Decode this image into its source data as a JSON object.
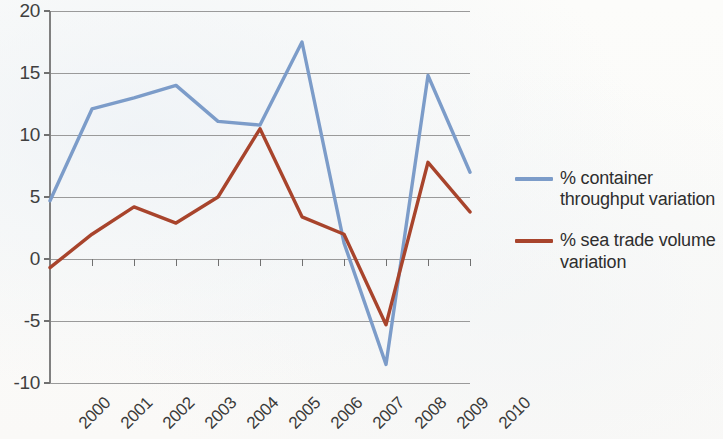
{
  "chart_data": {
    "type": "line",
    "title": "",
    "xlabel": "",
    "ylabel": "",
    "categories": [
      "2000",
      "2001",
      "2002",
      "2003",
      "2004",
      "2005",
      "2006",
      "2007",
      "2008",
      "2009",
      "2010"
    ],
    "ylim": [
      -10,
      20
    ],
    "yticks": [
      -10,
      -5,
      0,
      5,
      10,
      15,
      20
    ],
    "ytick_labels": [
      "-10",
      "-5",
      "0",
      "5",
      "10",
      "15",
      "20"
    ],
    "grid": true,
    "grid_axis": "y",
    "legend_position": "right",
    "series": [
      {
        "name": "% container throughput variation",
        "color": "#7c9cc9",
        "values": [
          4.7,
          12.1,
          13.0,
          14.0,
          11.1,
          10.8,
          17.5,
          1.3,
          -8.5,
          14.8,
          7.0
        ]
      },
      {
        "name": "% sea trade volume variation",
        "color": "#a8442c",
        "values": [
          -0.7,
          2.0,
          4.2,
          2.9,
          5.0,
          10.5,
          3.4,
          2.0,
          -5.3,
          7.8,
          3.8
        ]
      }
    ]
  },
  "style": {
    "axis_color": "#808080",
    "grid_color": "#9a9a9a",
    "tick_color": "#707070",
    "background": "#fdfdfb"
  }
}
